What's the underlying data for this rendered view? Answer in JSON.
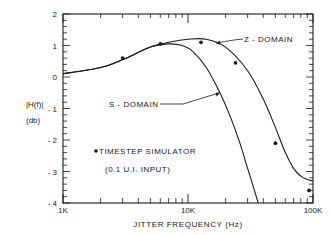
{
  "chart_data": {
    "type": "line",
    "title": "",
    "xlabel": "JITTER FREQUENCY (Hz)",
    "ylabel_line1": "|H(f)|",
    "ylabel_line2": "(db)",
    "xscale": "log",
    "xlim": [
      1000,
      100000
    ],
    "ylim": [
      -4,
      2
    ],
    "x_tick_labels": [
      "1K",
      "10K",
      "100K"
    ],
    "y_tick_labels": [
      "2",
      "1",
      "0",
      "- 1",
      "- 2",
      "- 3",
      "- 4"
    ],
    "y_tick_values": [
      2,
      1,
      0,
      -1,
      -2,
      -3,
      -4
    ],
    "grid": false,
    "series": [
      {
        "name": "Z - DOMAIN",
        "style": "line",
        "x": [
          1000,
          2000,
          3000,
          5000,
          7000,
          10000,
          14000,
          20000,
          30000,
          40000,
          50000,
          60000,
          70000,
          80000,
          90000,
          100000
        ],
        "y": [
          0.1,
          0.3,
          0.55,
          0.95,
          1.1,
          1.2,
          1.2,
          0.95,
          0.2,
          -0.7,
          -1.6,
          -2.4,
          -2.9,
          -3.15,
          -3.25,
          -3.3
        ]
      },
      {
        "name": "S - DOMAIN",
        "style": "line",
        "x": [
          1000,
          2000,
          3000,
          5000,
          7000,
          9000,
          11000,
          14000,
          18000,
          22000,
          26000,
          30000,
          34000,
          36500
        ],
        "y": [
          0.1,
          0.3,
          0.55,
          0.95,
          1.05,
          1.0,
          0.8,
          0.3,
          -0.5,
          -1.3,
          -2.1,
          -2.9,
          -3.6,
          -4.0
        ]
      },
      {
        "name": "TIMESTEP SIMULATOR (0.1 U.I. INPUT)",
        "style": "points",
        "x": [
          3000,
          6000,
          12700,
          24000,
          50000,
          93000
        ],
        "y": [
          0.6,
          1.05,
          1.1,
          0.45,
          -2.1,
          -3.6
        ]
      }
    ],
    "annotations": [
      {
        "text": "Z - DOMAIN",
        "target_series": "Z - DOMAIN"
      },
      {
        "text": "S - DOMAIN",
        "target_series": "S - DOMAIN"
      },
      {
        "text": "TIMESTEP SIMULATOR",
        "sub": "(0.1 U.I. INPUT)"
      }
    ]
  },
  "labels": {
    "z_domain": "Z - DOMAIN",
    "s_domain": "S - DOMAIN",
    "legend_line1": "TIMESTEP SIMULATOR",
    "legend_line2": "(0.1 U.I. INPUT)"
  },
  "colors": {
    "ink": "#1a1a1a",
    "background": "#ffffff"
  }
}
